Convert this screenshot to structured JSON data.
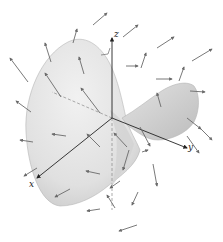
{
  "figure": {
    "axes": {
      "x_label": "x",
      "y_label": "y",
      "z_label": "z"
    },
    "colors": {
      "surface_light": "#e9e9e9",
      "surface_dark": "#bdbdbd",
      "arrow": "#6a6a6a",
      "axis": "#333333",
      "background": "#ffffff"
    },
    "arrows": [
      {
        "x1": 28,
        "y1": 82,
        "x2": 10,
        "y2": 58
      },
      {
        "x1": 31,
        "y1": 112,
        "x2": 16,
        "y2": 101
      },
      {
        "x1": 51,
        "y1": 62,
        "x2": 45,
        "y2": 43
      },
      {
        "x1": 73,
        "y1": 43,
        "x2": 77,
        "y2": 29
      },
      {
        "x1": 84,
        "y1": 74,
        "x2": 79,
        "y2": 57
      },
      {
        "x1": 61,
        "y1": 97,
        "x2": 45,
        "y2": 73
      },
      {
        "x1": 100,
        "y1": 113,
        "x2": 81,
        "y2": 88
      },
      {
        "x1": 93,
        "y1": 25,
        "x2": 107,
        "y2": 13
      },
      {
        "x1": 123,
        "y1": 37,
        "x2": 138,
        "y2": 25
      },
      {
        "x1": 126,
        "y1": 66,
        "x2": 138,
        "y2": 66
      },
      {
        "x1": 141,
        "y1": 68,
        "x2": 146,
        "y2": 53
      },
      {
        "x1": 157,
        "y1": 48,
        "x2": 174,
        "y2": 37
      },
      {
        "x1": 192,
        "y1": 61,
        "x2": 212,
        "y2": 49
      },
      {
        "x1": 156,
        "y1": 79,
        "x2": 172,
        "y2": 79
      },
      {
        "x1": 179,
        "y1": 81,
        "x2": 184,
        "y2": 67
      },
      {
        "x1": 190,
        "y1": 91,
        "x2": 205,
        "y2": 92
      },
      {
        "x1": 161,
        "y1": 107,
        "x2": 157,
        "y2": 93
      },
      {
        "x1": 187,
        "y1": 118,
        "x2": 201,
        "y2": 129
      },
      {
        "x1": 33,
        "y1": 142,
        "x2": 20,
        "y2": 140
      },
      {
        "x1": 66,
        "y1": 136,
        "x2": 52,
        "y2": 134
      },
      {
        "x1": 37,
        "y1": 168,
        "x2": 24,
        "y2": 176
      },
      {
        "x1": 70,
        "y1": 189,
        "x2": 55,
        "y2": 197
      },
      {
        "x1": 100,
        "y1": 147,
        "x2": 87,
        "y2": 134
      },
      {
        "x1": 100,
        "y1": 174,
        "x2": 86,
        "y2": 171
      },
      {
        "x1": 100,
        "y1": 209,
        "x2": 87,
        "y2": 211
      },
      {
        "x1": 115,
        "y1": 208,
        "x2": 107,
        "y2": 195
      },
      {
        "x1": 140,
        "y1": 127,
        "x2": 150,
        "y2": 146
      },
      {
        "x1": 127,
        "y1": 147,
        "x2": 114,
        "y2": 133
      },
      {
        "x1": 142,
        "y1": 152,
        "x2": 148,
        "y2": 150
      },
      {
        "x1": 138,
        "y1": 192,
        "x2": 132,
        "y2": 205
      },
      {
        "x1": 120,
        "y1": 181,
        "x2": 110,
        "y2": 188
      },
      {
        "x1": 129,
        "y1": 150,
        "x2": 123,
        "y2": 170
      },
      {
        "x1": 153,
        "y1": 164,
        "x2": 157,
        "y2": 186
      },
      {
        "x1": 187,
        "y1": 136,
        "x2": 199,
        "y2": 153
      },
      {
        "x1": 137,
        "y1": 225,
        "x2": 119,
        "y2": 231
      },
      {
        "x1": 200,
        "y1": 128,
        "x2": 212,
        "y2": 140
      }
    ]
  }
}
